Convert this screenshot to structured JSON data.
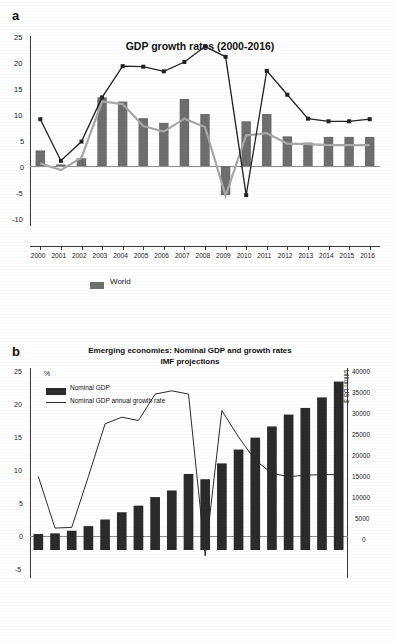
{
  "panel_a": {
    "letter": "a",
    "title": "GDP growth rates (2000-2016)",
    "legend": [
      {
        "label": "World",
        "color": "#6e6e6e",
        "type": "bar"
      }
    ]
  },
  "panel_b": {
    "letter": "b",
    "title_line1": "Emerging economies: Nominal GDP and growth rates",
    "title_line2": "IMF projections",
    "left_axis_label": "%",
    "right_axis_label": "billion US $",
    "legend": [
      {
        "label": "Nominal GDP",
        "color": "#2b2b2b",
        "type": "bar"
      },
      {
        "label": "Nominal GDP annual growth rate",
        "color": "#2b2b2b",
        "type": "line"
      }
    ]
  },
  "chart_data": [
    {
      "id": "panel-a",
      "type": "bar",
      "title": "GDP growth rates (2000-2016)",
      "xlabel": "",
      "ylabel": "",
      "ylim": [
        -10,
        25
      ],
      "yticks": [
        -10,
        -5,
        0,
        5,
        10,
        15,
        20,
        25
      ],
      "grid": false,
      "legend_position": "bottom-left",
      "categories": [
        "2000",
        "2001",
        "2002",
        "2003",
        "2004",
        "2005",
        "2006",
        "2007",
        "2008",
        "2009",
        "2010",
        "2011",
        "2012",
        "2013",
        "2014",
        "2015",
        "2016"
      ],
      "series": [
        {
          "name": "World",
          "kind": "bar",
          "color": "#6e6e6e",
          "values": [
            3.0,
            0.3,
            1.5,
            13.2,
            12.4,
            9.2,
            8.3,
            12.9,
            10.0,
            -5.6,
            8.6,
            10.0,
            5.7,
            4.5,
            5.6,
            5.6,
            5.6
          ]
        },
        {
          "name": "Emerging markets line (light)",
          "kind": "line",
          "color": "#a8a8a8",
          "values": [
            0.5,
            -0.8,
            1.6,
            12.4,
            11.9,
            7.7,
            6.6,
            9.1,
            7.5,
            -5.7,
            5.9,
            6.3,
            4.3,
            4.2,
            4.0,
            4.0,
            4.0
          ]
        },
        {
          "name": "Advanced economies line (dark, markers)",
          "kind": "line-marker",
          "color": "#222222",
          "values": [
            9.0,
            1.0,
            4.7,
            13.2,
            19.2,
            19.1,
            18.2,
            20.0,
            23.0,
            21.0,
            -5.6,
            18.3,
            13.7,
            9.1,
            8.6,
            8.6,
            9.0
          ]
        }
      ]
    },
    {
      "id": "panel-b",
      "type": "bar",
      "title": "Emerging economies: Nominal GDP and growth rates / IMF projections",
      "xlabel": "",
      "ylabel": "%",
      "y2label": "billion US $",
      "ylim": [
        -5,
        25
      ],
      "yticks": [
        -5,
        0,
        5,
        10,
        15,
        20,
        25
      ],
      "y2lim": [
        0,
        40000
      ],
      "y2ticks": [
        0,
        5000,
        10000,
        15000,
        20000,
        25000,
        30000,
        35000,
        40000
      ],
      "grid": false,
      "legend_position": "top-left",
      "categories": [
        "1",
        "2",
        "3",
        "4",
        "5",
        "6",
        "7",
        "8",
        "9",
        "10",
        "11",
        "12",
        "13",
        "14",
        "15",
        "16",
        "17",
        "18",
        "19"
      ],
      "series": [
        {
          "name": "Nominal GDP",
          "kind": "bar",
          "color": "#2b2b2b",
          "values": [
            0.3,
            0.4,
            0.8,
            1.5,
            2.5,
            3.6,
            4.6,
            5.9,
            6.9,
            9.4,
            8.6,
            11.0,
            13.1,
            14.9,
            16.6,
            18.4,
            19.4,
            21.0,
            23.4
          ]
        },
        {
          "name": "Nominal GDP annual growth rate",
          "kind": "line",
          "color": "#2b2b2b",
          "values": [
            9.0,
            1.2,
            1.3,
            9.0,
            17.0,
            18.0,
            17.5,
            21.5,
            22.0,
            21.5,
            -3.0,
            19.0,
            15.0,
            11.5,
            9.5,
            9.0,
            9.2,
            9.3,
            9.3
          ]
        }
      ]
    }
  ]
}
